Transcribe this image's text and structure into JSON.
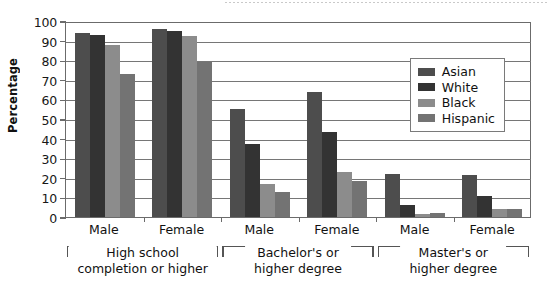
{
  "chart_data": {
    "type": "bar",
    "title": "",
    "subtitle": "",
    "xlabel": "",
    "ylabel": "Percentage",
    "ylim": [
      0,
      100
    ],
    "ytick_step": 10,
    "yticks": [
      0,
      10,
      20,
      30,
      40,
      50,
      60,
      70,
      80,
      90,
      100
    ],
    "grid": true,
    "grid_axis": "y",
    "legend_position": "top-right inside plot",
    "categories": [
      "Male",
      "Female",
      "Male",
      "Female",
      "Male",
      "Female"
    ],
    "category_groups": [
      {
        "label": "High school\ncompletion or higher",
        "line1": "High school",
        "line2": "completion or higher",
        "spans": [
          "Male",
          "Female"
        ]
      },
      {
        "label": "Bachelor's or\nhigher degree",
        "line1": "Bachelor's or",
        "line2": "higher degree",
        "spans": [
          "Male",
          "Female"
        ]
      },
      {
        "label": "Master's or\nhigher degree",
        "line1": "Master's or",
        "line2": "higher degree",
        "spans": [
          "Male",
          "Female"
        ]
      }
    ],
    "series": [
      {
        "name": "Asian",
        "color": "#4d4d4d",
        "values": [
          94,
          96,
          55,
          64,
          22,
          21.5
        ]
      },
      {
        "name": "White",
        "color": "#333333",
        "values": [
          93,
          95,
          37,
          43.5,
          6,
          10.5
        ]
      },
      {
        "name": "Black",
        "color": "#8c8c8c",
        "values": [
          88,
          92.5,
          17,
          23,
          1.5,
          4
        ]
      },
      {
        "name": "Hispanic",
        "color": "#737373",
        "values": [
          73,
          79,
          13,
          18.5,
          2,
          4
        ]
      }
    ]
  },
  "axis": {
    "y_title": "Percentage",
    "y_labels": [
      "100",
      "90",
      "80",
      "70",
      "60",
      "50",
      "40",
      "30",
      "20",
      "10",
      "0"
    ]
  },
  "legend": {
    "items": [
      {
        "label": "Asian",
        "color": "#4d4d4d"
      },
      {
        "label": "White",
        "color": "#333333"
      },
      {
        "label": "Black",
        "color": "#8c8c8c"
      },
      {
        "label": "Hispanic",
        "color": "#737373"
      }
    ]
  },
  "x_axis_labels": [
    "Male",
    "Female",
    "Male",
    "Female",
    "Male",
    "Female"
  ],
  "brackets": [
    {
      "line1": "High school",
      "line2": "completion or higher"
    },
    {
      "line1": "Bachelor's or",
      "line2": "higher degree"
    },
    {
      "line1": "Master's or",
      "line2": "higher degree"
    }
  ],
  "colors": {
    "asian": "#4d4d4d",
    "white": "#333333",
    "black": "#8c8c8c",
    "hispanic": "#737373",
    "axis": "#6b6b6b",
    "grid": "#767676",
    "text": "#111111",
    "background": "#ffffff"
  }
}
